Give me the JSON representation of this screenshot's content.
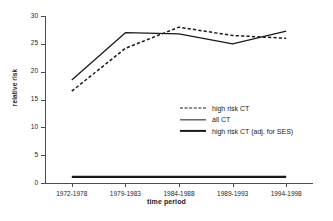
{
  "chart_data": {
    "type": "line",
    "title": "",
    "xlabel": "time period",
    "ylabel": "relative risk",
    "categories": [
      "1972-1978",
      "1979-1983",
      "1984-1988",
      "1989-1993",
      "1994-1998"
    ],
    "ylim": [
      0,
      30
    ],
    "yticks": [
      0,
      5,
      10,
      15,
      20,
      25,
      30
    ],
    "grid": false,
    "legend_position": "center-right",
    "series": [
      {
        "name": "high risk CT",
        "style": "dashed",
        "values": [
          16.5,
          24.2,
          28.0,
          26.5,
          26.0
        ]
      },
      {
        "name": "all CT",
        "style": "solid-thin",
        "values": [
          18.5,
          27.0,
          26.8,
          25.0,
          27.3
        ]
      },
      {
        "name": "high risk CT (adj. for SES)",
        "style": "solid-thick",
        "values": [
          1.1,
          1.1,
          1.1,
          1.1,
          1.1
        ]
      }
    ]
  },
  "axes": {
    "ytick_labels": [
      "0",
      "5",
      "10",
      "15",
      "20",
      "25",
      "30"
    ],
    "xtick_labels": [
      "1972-1978",
      "1979-1983",
      "1984-1988",
      "1989-1993",
      "1994-1998"
    ],
    "ylabel_text": "relative risk",
    "xlabel_text": "time period"
  },
  "legend": {
    "items": [
      {
        "label": "high risk CT",
        "style": "dashed"
      },
      {
        "label": "all CT",
        "style": "solid-thin"
      },
      {
        "label": "high risk CT (adj. for SES)",
        "style": "solid-thick"
      }
    ]
  },
  "colors": {
    "line": "#1a1a1a",
    "axis": "#4d4d4d",
    "background": "#ffffff",
    "text": "#262626"
  }
}
